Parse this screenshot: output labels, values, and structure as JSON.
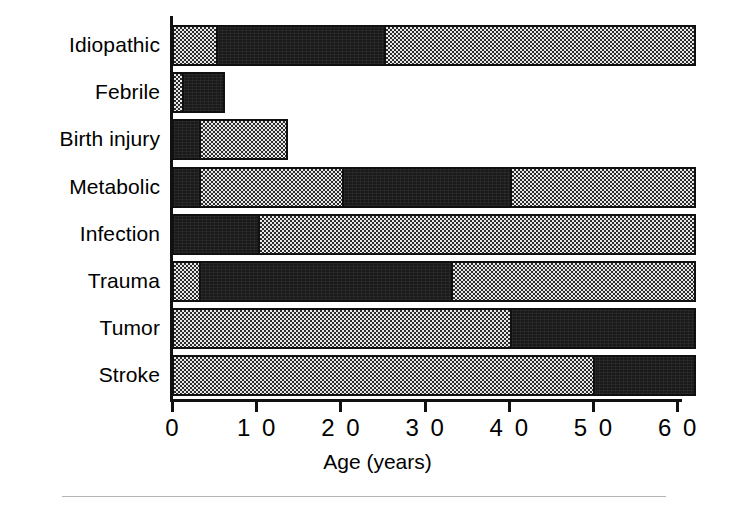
{
  "figure": {
    "background_color": "#ffffff",
    "axis_color": "#111111",
    "segment_colors": {
      "dark": "#1a1a1a",
      "light": "#c9c9c9"
    },
    "footer_rule": "horizontal-rule"
  },
  "chart_data": {
    "type": "bar",
    "orientation": "horizontal",
    "stacked": true,
    "title": "",
    "xlabel": "Age (years)",
    "ylabel": "",
    "xlim": [
      0,
      62
    ],
    "ylim": [
      0,
      8
    ],
    "grid": false,
    "legend": null,
    "xticks": [
      0,
      10,
      20,
      30,
      40,
      50,
      60
    ],
    "xtick_labels": [
      "0",
      "1 0",
      "2 0",
      "3 0",
      "4 0",
      "5 0",
      "6 0"
    ],
    "categories": [
      "Idiopathic",
      "Febrile",
      "Birth injury",
      "Metabolic",
      "Infection",
      "Trauma",
      "Tumor",
      "Stroke"
    ],
    "bars": [
      {
        "category": "Idiopathic",
        "total": 62,
        "segments": [
          {
            "shade": "light",
            "start": 0,
            "end": 5,
            "length": 5
          },
          {
            "shade": "dark",
            "start": 5,
            "end": 25,
            "length": 20
          },
          {
            "shade": "light",
            "start": 25,
            "end": 62,
            "length": 37
          }
        ]
      },
      {
        "category": "Febrile",
        "total": 6,
        "segments": [
          {
            "shade": "light",
            "start": 0,
            "end": 1,
            "length": 1
          },
          {
            "shade": "dark",
            "start": 1,
            "end": 6,
            "length": 5
          }
        ]
      },
      {
        "category": "Birth injury",
        "total": 13.5,
        "segments": [
          {
            "shade": "dark",
            "start": 0,
            "end": 3,
            "length": 3
          },
          {
            "shade": "light",
            "start": 3,
            "end": 13.5,
            "length": 10.5
          }
        ]
      },
      {
        "category": "Metabolic",
        "total": 62,
        "segments": [
          {
            "shade": "dark",
            "start": 0,
            "end": 3,
            "length": 3
          },
          {
            "shade": "light",
            "start": 3,
            "end": 20,
            "length": 17
          },
          {
            "shade": "dark",
            "start": 20,
            "end": 40,
            "length": 20
          },
          {
            "shade": "light",
            "start": 40,
            "end": 62,
            "length": 22
          }
        ]
      },
      {
        "category": "Infection",
        "total": 62,
        "segments": [
          {
            "shade": "dark",
            "start": 0,
            "end": 10,
            "length": 10
          },
          {
            "shade": "light",
            "start": 10,
            "end": 62,
            "length": 52
          }
        ]
      },
      {
        "category": "Trauma",
        "total": 62,
        "segments": [
          {
            "shade": "light",
            "start": 0,
            "end": 3,
            "length": 3
          },
          {
            "shade": "dark",
            "start": 3,
            "end": 33,
            "length": 30
          },
          {
            "shade": "light",
            "start": 33,
            "end": 62,
            "length": 29
          }
        ]
      },
      {
        "category": "Tumor",
        "total": 62,
        "segments": [
          {
            "shade": "light",
            "start": 0,
            "end": 40,
            "length": 40
          },
          {
            "shade": "dark",
            "start": 40,
            "end": 62,
            "length": 22
          }
        ]
      },
      {
        "category": "Stroke",
        "total": 62,
        "segments": [
          {
            "shade": "light",
            "start": 0,
            "end": 50,
            "length": 50
          },
          {
            "shade": "dark",
            "start": 50,
            "end": 62,
            "length": 12
          }
        ]
      }
    ]
  }
}
